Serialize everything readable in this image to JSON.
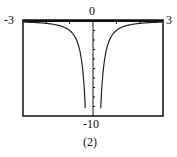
{
  "caption": "(2)",
  "chart_data": {
    "type": "line",
    "title": "",
    "xlabel": "",
    "ylabel": "",
    "xlim": [
      -3,
      3
    ],
    "ylim": [
      -10,
      0
    ],
    "tick_labels": {
      "x_min": "-3",
      "x_max": "3",
      "y_max": "0",
      "y_min": "-10"
    },
    "grid": false,
    "series": [
      {
        "name": "y = -1/x^2",
        "x": [
          -3,
          -2.5,
          -2,
          -1.5,
          -1.2,
          -1,
          -0.8,
          -0.6,
          -0.5,
          -0.4,
          -0.33,
          0.33,
          0.4,
          0.5,
          0.6,
          0.8,
          1,
          1.2,
          1.5,
          2,
          2.5,
          3
        ],
        "y": [
          -0.11,
          -0.16,
          -0.25,
          -0.44,
          -0.69,
          -1,
          -1.56,
          -2.78,
          -4,
          -6.25,
          -9.2,
          -9.2,
          -6.25,
          -4,
          -2.78,
          -1.56,
          -1,
          -0.69,
          -0.44,
          -0.25,
          -0.16,
          -0.11
        ]
      }
    ]
  }
}
